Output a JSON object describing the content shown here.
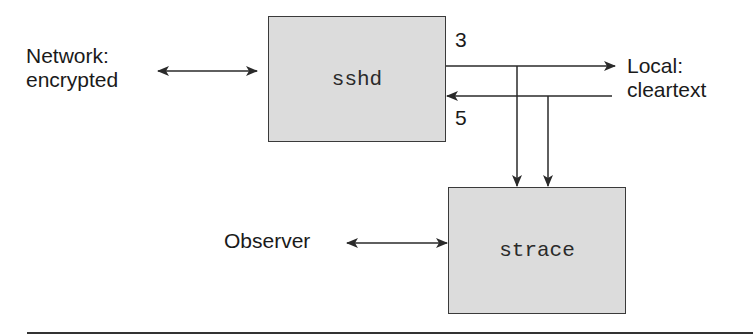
{
  "diagram": {
    "nodes": {
      "sshd": {
        "label": "sshd"
      },
      "strace": {
        "label": "strace"
      }
    },
    "labels": {
      "network_line1": "Network:",
      "network_line2": "encrypted",
      "local_line1": "Local:",
      "local_line2": "cleartext",
      "observer": "Observer",
      "fd_out": "3",
      "fd_in": "5"
    },
    "edges": [
      {
        "from": "network",
        "to": "sshd",
        "type": "bidirectional"
      },
      {
        "from": "sshd",
        "to": "local",
        "label": "3",
        "type": "directed"
      },
      {
        "from": "local",
        "to": "sshd",
        "label": "5",
        "type": "directed"
      },
      {
        "from": "fd3-line",
        "to": "strace",
        "type": "directed"
      },
      {
        "from": "fd5-line",
        "to": "strace",
        "type": "directed"
      },
      {
        "from": "observer",
        "to": "strace",
        "type": "bidirectional"
      }
    ],
    "colors": {
      "box_fill": "#dcdcdc",
      "stroke": "#2a2a2a"
    }
  }
}
